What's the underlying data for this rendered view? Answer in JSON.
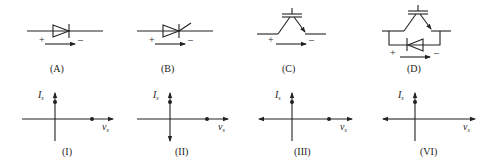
{
  "circuits": [
    {
      "id": "A",
      "label": "(A)",
      "symbol": "diode",
      "plus": "+",
      "minus": "–"
    },
    {
      "id": "B",
      "label": "(B)",
      "symbol": "thyristor",
      "plus": "+",
      "minus": "–"
    },
    {
      "id": "C",
      "label": "(C)",
      "symbol": "igbt",
      "plus": "+",
      "minus": "–"
    },
    {
      "id": "D",
      "label": "(D)",
      "symbol": "igbt-with-antiparallel-diode",
      "plus": "+",
      "minus": "–"
    }
  ],
  "graphs": [
    {
      "id": "I",
      "label": "(I)",
      "y_axis": "I",
      "y_sub": "s",
      "x_axis": "v",
      "x_sub": "s",
      "y_arrow_down": false,
      "x_arrow_left": false,
      "dot_on_y": true,
      "dot_on_x": true
    },
    {
      "id": "II",
      "label": "(II)",
      "y_axis": "I",
      "y_sub": "s",
      "x_axis": "v",
      "x_sub": "s",
      "y_arrow_down": true,
      "x_arrow_left": false,
      "dot_on_y": true,
      "dot_on_x": true
    },
    {
      "id": "III",
      "label": "(III)",
      "y_axis": "I",
      "y_sub": "s",
      "x_axis": "v",
      "x_sub": "s",
      "y_arrow_down": false,
      "x_arrow_left": true,
      "dot_on_y": true,
      "dot_on_x": true
    },
    {
      "id": "VI",
      "label": "(VI)",
      "y_axis": "I",
      "y_sub": "s",
      "x_axis": "v",
      "x_sub": "s",
      "y_arrow_down": false,
      "x_arrow_left": true,
      "dot_on_y": true,
      "dot_on_x": false
    }
  ]
}
